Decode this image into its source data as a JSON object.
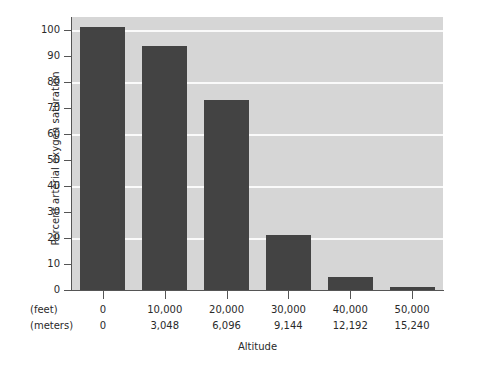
{
  "chart_data": {
    "type": "bar",
    "title": "",
    "xlabel": "Altitude",
    "ylabel": "Percent arterial oxygen saturation",
    "categories": [
      "0",
      "10,000",
      "20,000",
      "30,000",
      "40,000",
      "50,000"
    ],
    "categories_secondary": [
      "0",
      "3,048",
      "6,096",
      "9,144",
      "12,192",
      "15,240"
    ],
    "category_axis_rows": [
      {
        "unit_label": "(feet)",
        "values": [
          "0",
          "10,000",
          "20,000",
          "30,000",
          "40,000",
          "50,000"
        ]
      },
      {
        "unit_label": "(meters)",
        "values": [
          "0",
          "3,048",
          "6,096",
          "9,144",
          "12,192",
          "15,240"
        ]
      }
    ],
    "values": [
      101,
      94,
      73,
      21,
      5,
      1
    ],
    "ylim": [
      0,
      105
    ],
    "ytick_labels": [
      "0",
      "10",
      "20",
      "30",
      "40",
      "50",
      "60",
      "70",
      "80",
      "90",
      "100"
    ],
    "ytick_values": [
      0,
      10,
      20,
      30,
      40,
      50,
      60,
      70,
      80,
      90,
      100
    ],
    "gridline_values": [
      20,
      40,
      60,
      80,
      100
    ],
    "grid": true,
    "legend": false,
    "legend_position": "none",
    "colors": {
      "bar": "#434343",
      "plot_background": "#d6d6d6",
      "gridline": "#fafafa",
      "axis": "#555555",
      "text": "#2a2a2a",
      "figure_background": "#ffffff"
    }
  }
}
